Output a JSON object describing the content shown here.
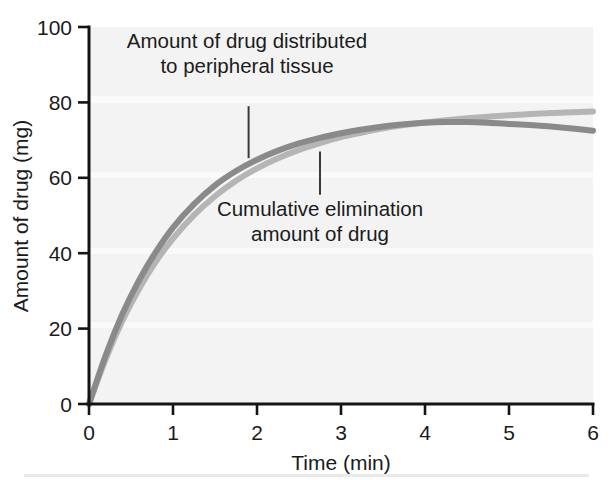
{
  "chart_data": {
    "type": "line",
    "title": "",
    "xlabel": "Time (min)",
    "ylabel": "Amount of drug (mg)",
    "xlim": [
      0,
      6
    ],
    "ylim": [
      0,
      100
    ],
    "xticks": [
      0,
      1,
      2,
      3,
      4,
      5,
      6
    ],
    "yticks": [
      0,
      20,
      40,
      60,
      80,
      100
    ],
    "xtick_labels": [
      "0",
      "1",
      "2",
      "3",
      "4",
      "5",
      "6"
    ],
    "ytick_labels": [
      "0",
      "20",
      "40",
      "60",
      "80",
      "100"
    ],
    "grid": false,
    "legend_position": "none",
    "x": [
      0,
      0.2,
      0.4,
      0.6,
      0.8,
      1.0,
      1.25,
      1.5,
      1.75,
      2.0,
      2.25,
      2.5,
      2.75,
      3.0,
      3.25,
      3.5,
      3.75,
      4.0,
      4.25,
      4.5,
      4.75,
      5.0,
      5.25,
      5.5,
      5.75,
      6.0
    ],
    "series": [
      {
        "name": "Amount of drug distributed to peripheral tissue",
        "color": "#8a8a8a",
        "values": [
          0,
          13.0,
          24.0,
          33.0,
          40.5,
          46.8,
          53.0,
          58.0,
          61.8,
          64.8,
          67.2,
          69.1,
          70.6,
          71.8,
          72.8,
          73.6,
          74.2,
          74.6,
          74.8,
          74.8,
          74.6,
          74.3,
          74.0,
          73.6,
          73.1,
          72.5
        ]
      },
      {
        "name": "Cumulative elimination amount of drug",
        "color": "#b5b5b5",
        "values": [
          0,
          12.0,
          22.2,
          30.7,
          37.9,
          43.9,
          50.1,
          55.1,
          59.2,
          62.5,
          65.2,
          67.4,
          69.2,
          70.8,
          72.0,
          73.1,
          74.0,
          74.7,
          75.3,
          75.8,
          76.2,
          76.6,
          76.9,
          77.2,
          77.4,
          77.6
        ]
      }
    ],
    "annotations": [
      {
        "id": "annotation-peripheral-tissue",
        "lines": [
          "Amount of drug distributed",
          "to peripheral tissue"
        ],
        "leader_from": {
          "x": 1.9,
          "y": 79.0
        },
        "leader_to": {
          "x": 1.9,
          "y": 65.2
        }
      },
      {
        "id": "annotation-cumulative-elimination",
        "lines": [
          "Cumulative elimination",
          "amount of drug"
        ],
        "leader_from": {
          "x": 2.75,
          "y": 67.0
        },
        "leader_to": {
          "x": 2.75,
          "y": 55.5
        }
      }
    ]
  },
  "colors": {
    "series_peripheral": "#8a8a8a",
    "series_elimination": "#b5b5b5",
    "axis": "#141414",
    "text": "#1b1b1b",
    "plot_background": "#f3f3f3",
    "page_background": "#ffffff"
  }
}
